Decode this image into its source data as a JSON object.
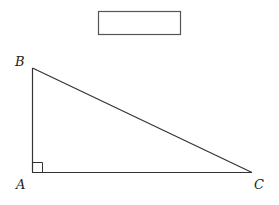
{
  "diagram": {
    "type": "right-triangle",
    "answer_box": {
      "value": ""
    },
    "vertices": {
      "A": {
        "label": "A",
        "x": 32,
        "y": 172
      },
      "B": {
        "label": "B",
        "x": 32,
        "y": 68
      },
      "C": {
        "label": "C",
        "x": 252,
        "y": 172
      }
    },
    "right_angle_at": "A",
    "stroke_color": "#333333"
  }
}
